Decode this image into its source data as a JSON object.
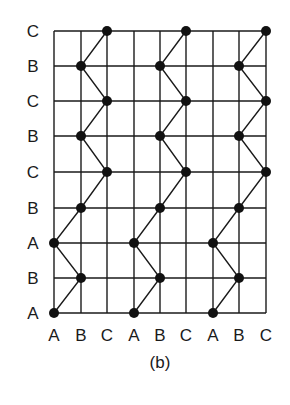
{
  "figure": {
    "caption": "(b)",
    "grid": {
      "x_positions": [
        54,
        81,
        107,
        134,
        160,
        186,
        213,
        239,
        266
      ],
      "y_positions": [
        31,
        66,
        101,
        136,
        172,
        208,
        243,
        278,
        313
      ],
      "line_color": "#1a1a1a"
    },
    "column_labels": [
      "A",
      "B",
      "C",
      "A",
      "B",
      "C",
      "A",
      "B",
      "C"
    ],
    "row_labels_top_to_bottom": [
      "C",
      "B",
      "C",
      "B",
      "C",
      "B",
      "A",
      "B",
      "A"
    ],
    "path_sequence_bottom_to_top": [
      "A",
      "B",
      "A",
      "B",
      "C",
      "B",
      "C",
      "B",
      "C"
    ],
    "paths": [
      {
        "name": "path-group-1",
        "columns": {
          "A": 0,
          "B": 1,
          "C": 2
        }
      },
      {
        "name": "path-group-2",
        "columns": {
          "A": 3,
          "B": 4,
          "C": 5
        }
      },
      {
        "name": "path-group-3",
        "columns": {
          "A": 6,
          "B": 7,
          "C": 8
        }
      }
    ],
    "node_color": "#111111",
    "node_radius": 5
  }
}
